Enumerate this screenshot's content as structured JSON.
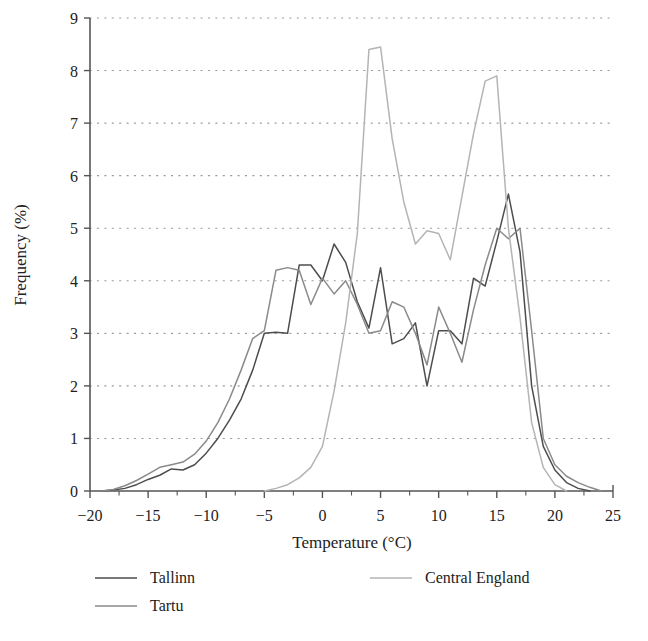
{
  "chart_data": {
    "type": "line",
    "title": "",
    "xlabel": "Temperature (°C)",
    "ylabel": "Frequency (%)",
    "xlim": [
      -20,
      25
    ],
    "ylim": [
      0,
      9
    ],
    "xticks": [
      -20,
      -15,
      -10,
      -5,
      0,
      5,
      10,
      15,
      20,
      25
    ],
    "xtick_labels": [
      "−20",
      "−15",
      "−10",
      "−5",
      "0",
      "5",
      "10",
      "15",
      "20",
      "25"
    ],
    "yticks": [
      0,
      1,
      2,
      3,
      4,
      5,
      6,
      7,
      8,
      9
    ],
    "ytick_labels": [
      "0",
      "1",
      "2",
      "3",
      "4",
      "5",
      "6",
      "7",
      "8",
      "9"
    ],
    "minor_xtick_step": 2.5,
    "grid": "horizontal-dotted",
    "legend_position": "below-plot",
    "series": [
      {
        "name": "Tallinn",
        "color": "#4d4d4d",
        "x": [
          -19,
          -18,
          -17,
          -16,
          -15,
          -14,
          -13,
          -12,
          -11,
          -10,
          -9,
          -8,
          -7,
          -6,
          -5,
          -4,
          -3,
          -2,
          -1,
          0,
          1,
          2,
          3,
          4,
          5,
          6,
          7,
          8,
          9,
          10,
          11,
          12,
          13,
          14,
          15,
          16,
          17,
          18,
          19,
          20,
          21,
          22,
          23
        ],
        "y": [
          0.0,
          0.02,
          0.05,
          0.12,
          0.22,
          0.3,
          0.42,
          0.4,
          0.5,
          0.72,
          1.0,
          1.35,
          1.75,
          2.3,
          3.0,
          3.02,
          3.0,
          4.3,
          4.3,
          4.0,
          4.7,
          4.35,
          3.6,
          3.1,
          4.25,
          2.8,
          2.9,
          3.2,
          2.0,
          3.05,
          3.05,
          2.8,
          4.05,
          3.9,
          4.75,
          5.65,
          4.55,
          2.0,
          0.85,
          0.4,
          0.16,
          0.05,
          0.0
        ]
      },
      {
        "name": "Tartu",
        "color": "#8a8a8a",
        "x": [
          -19,
          -18,
          -17,
          -16,
          -15,
          -14,
          -13,
          -12,
          -11,
          -10,
          -9,
          -8,
          -7,
          -6,
          -5,
          -4,
          -3,
          -2,
          -1,
          0,
          1,
          2,
          3,
          4,
          5,
          6,
          7,
          8,
          9,
          10,
          11,
          12,
          13,
          14,
          15,
          16,
          17,
          18,
          19,
          20,
          21,
          22,
          23,
          24
        ],
        "y": [
          0.0,
          0.03,
          0.1,
          0.2,
          0.32,
          0.45,
          0.5,
          0.55,
          0.7,
          0.95,
          1.3,
          1.75,
          2.3,
          2.9,
          3.05,
          4.2,
          4.25,
          4.2,
          3.55,
          4.05,
          3.75,
          4.0,
          3.55,
          3.0,
          3.05,
          3.6,
          3.5,
          3.0,
          2.4,
          3.5,
          3.0,
          2.45,
          3.45,
          4.3,
          5.0,
          4.8,
          5.0,
          3.05,
          1.0,
          0.5,
          0.28,
          0.16,
          0.07,
          0.0
        ]
      },
      {
        "name": "Central England",
        "color": "#b4b4b4",
        "x": [
          -5,
          -4,
          -3,
          -2,
          -1,
          0,
          1,
          2,
          3,
          4,
          5,
          6,
          7,
          8,
          9,
          10,
          11,
          12,
          13,
          14,
          15,
          16,
          17,
          18,
          19,
          20,
          21
        ],
        "y": [
          0.0,
          0.05,
          0.12,
          0.25,
          0.45,
          0.85,
          1.9,
          3.2,
          4.9,
          8.4,
          8.45,
          6.7,
          5.5,
          4.7,
          4.95,
          4.9,
          4.4,
          5.6,
          6.8,
          7.8,
          7.9,
          5.0,
          3.3,
          1.3,
          0.45,
          0.12,
          0.0
        ]
      }
    ]
  },
  "legend": {
    "entries": [
      {
        "label": "Tallinn",
        "color": "#4d4d4d"
      },
      {
        "label": "Tartu",
        "color": "#8a8a8a"
      },
      {
        "label": "Central England",
        "color": "#b4b4b4"
      }
    ]
  },
  "axes": {
    "x_title": "Temperature (°C)",
    "y_title": "Frequency (%)"
  },
  "colors": {
    "background": "#ffffff",
    "axis": "#555555",
    "grid_dot": "#9a9a9a",
    "text": "#222222"
  }
}
